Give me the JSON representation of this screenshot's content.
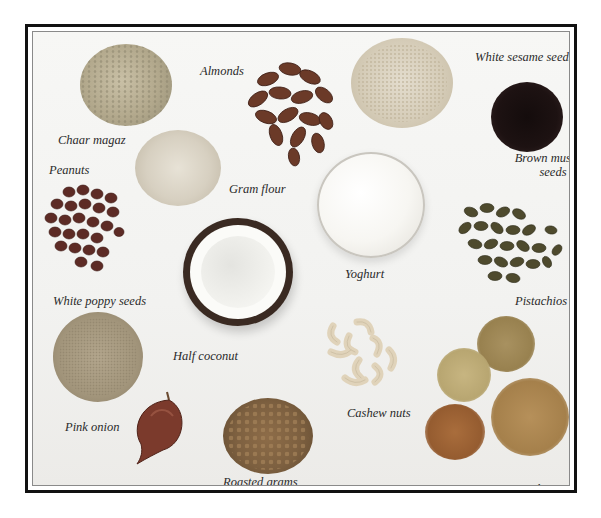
{
  "figure": {
    "frame_color": "#111111",
    "background": "#f4f4f2"
  },
  "items": [
    {
      "id": "chaar-magaz",
      "label": "Chaar magaz",
      "color": "#b7ad94"
    },
    {
      "id": "almonds",
      "label": "Almonds",
      "color": "#6e3f2c"
    },
    {
      "id": "white-sesame-seeds",
      "label": "White sesame seeds",
      "color": "#d8cdb8"
    },
    {
      "id": "brown-mustard-seeds",
      "label": "Brown mustard seeds",
      "color": "#1f1414"
    },
    {
      "id": "peanuts",
      "label": "Peanuts",
      "color": "#5a2a24"
    },
    {
      "id": "gram-flour",
      "label": "Gram flour",
      "color": "#d6d0c2"
    },
    {
      "id": "yoghurt",
      "label": "Yoghurt",
      "color": "#f8f8f5"
    },
    {
      "id": "pistachios",
      "label": "Pistachios",
      "color": "#4f4a2e"
    },
    {
      "id": "half-coconut",
      "label": "Half coconut",
      "color": "#3a2a22"
    },
    {
      "id": "white-poppy-seeds",
      "label": "White poppy seeds",
      "color": "#a89a82"
    },
    {
      "id": "cashew-nuts",
      "label": "Cashew nuts",
      "color": "#e2d6bf"
    },
    {
      "id": "pink-onion",
      "label": "Pink onion",
      "color": "#7a3a2a"
    },
    {
      "id": "roasted-grams",
      "label": "Roasted grams",
      "color": "#8a6a45"
    },
    {
      "id": "lentils",
      "label": "Lentils",
      "color": "#b08f5a"
    }
  ]
}
